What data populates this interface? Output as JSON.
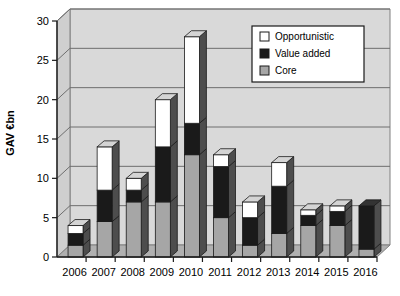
{
  "chart_data": {
    "type": "bar",
    "stacked": true,
    "title": "",
    "xlabel": "",
    "ylabel": "GAV €bn",
    "ylim": [
      0,
      30
    ],
    "yticks": [
      0,
      5,
      10,
      15,
      20,
      25,
      30
    ],
    "ytick_labels": [
      "0",
      "5",
      "10",
      "15",
      "20",
      "25",
      "30"
    ],
    "grid": true,
    "grid_axis": "y",
    "legend_position": "top-right",
    "categories": [
      "2006",
      "2007",
      "2008",
      "2009",
      "2010",
      "2011",
      "2012",
      "2013",
      "2014",
      "2015",
      "2016"
    ],
    "series": [
      {
        "name": "Core",
        "color": "#a6a6a6",
        "values": [
          1.5,
          4.5,
          7.0,
          7.0,
          13.0,
          5.0,
          1.5,
          3.0,
          4.0,
          4.0,
          1.0
        ]
      },
      {
        "name": "Value added",
        "color": "#1a1a1a",
        "values": [
          1.5,
          4.0,
          1.5,
          7.0,
          4.0,
          6.5,
          3.5,
          6.0,
          1.3,
          1.8,
          5.5
        ]
      },
      {
        "name": "Opportunistic",
        "color": "#ffffff",
        "values": [
          1.0,
          5.5,
          1.5,
          6.0,
          11.0,
          1.5,
          2.0,
          3.0,
          0.7,
          0.7,
          0.0
        ]
      }
    ],
    "totals": [
      4.0,
      14.0,
      10.0,
      20.0,
      28.0,
      13.0,
      7.0,
      12.0,
      6.0,
      6.5,
      6.5
    ]
  },
  "legend": {
    "items": [
      {
        "label": "Opportunistic",
        "swatch": "#ffffff"
      },
      {
        "label": "Value added",
        "swatch": "#1a1a1a"
      },
      {
        "label": "Core",
        "swatch": "#a6a6a6"
      }
    ]
  },
  "colors": {
    "plot_background": "#d9d9d9",
    "floor": "#b0b0b0",
    "gridline": "#6e6e6e",
    "axis": "#1a1a1a",
    "bar_side": "#4d4d4d",
    "bar_top_core": "#8c8c8c",
    "bar_top_value": "#333333",
    "bar_top_opportunistic": "#d4d4d4",
    "legend_background": "#ffffff",
    "legend_border": "#1a1a1a"
  }
}
